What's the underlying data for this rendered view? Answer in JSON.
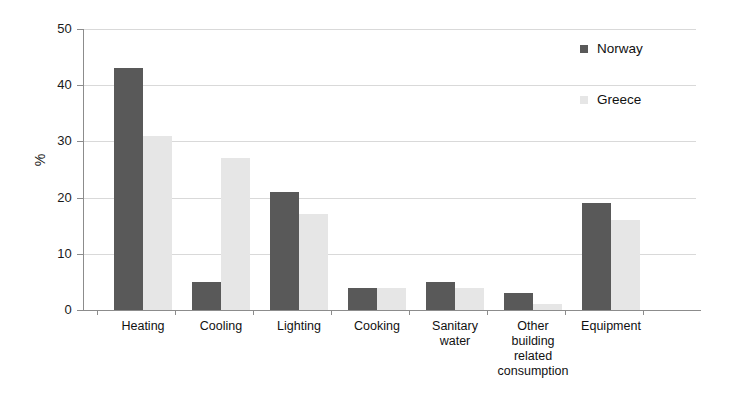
{
  "chart_data": {
    "type": "bar",
    "title": "",
    "subtitle": "",
    "xlabel": "",
    "ylabel": "%",
    "ylim": [
      0,
      50
    ],
    "yticks": [
      0,
      10,
      20,
      30,
      40,
      50
    ],
    "grid": true,
    "legend_position": "right-top",
    "categories": [
      "Heating",
      "Cooling",
      "Lighting",
      "Cooking",
      "Sanitary water",
      "Other building related consumption",
      "Equipment"
    ],
    "category_lines": [
      [
        "Heating"
      ],
      [
        "Cooling"
      ],
      [
        "Lighting"
      ],
      [
        "Cooking"
      ],
      [
        "Sanitary",
        "water"
      ],
      [
        "Other",
        "building",
        "related",
        "consumption"
      ],
      [
        "Equipment"
      ]
    ],
    "series": [
      {
        "name": "Norway",
        "color": "#595959",
        "values": [
          43,
          5,
          21,
          4,
          5,
          3,
          19
        ]
      },
      {
        "name": "Greece",
        "color": "#e6e6e6",
        "values": [
          31,
          27,
          17,
          4,
          4,
          1,
          16
        ]
      }
    ]
  },
  "legend": {
    "items": [
      {
        "label": "Norway",
        "color": "#595959"
      },
      {
        "label": "Greece",
        "color": "#e6e6e6"
      }
    ]
  },
  "axis": {
    "y_title": "%",
    "y_tick_labels": [
      "50",
      "40",
      "30",
      "20",
      "10",
      "0"
    ]
  },
  "colors": {
    "norway": "#595959",
    "greece": "#e6e6e6",
    "gridline": "#d9d9d9",
    "axis": "#8c8c8c",
    "background": "#ffffff",
    "text": "#111111"
  }
}
